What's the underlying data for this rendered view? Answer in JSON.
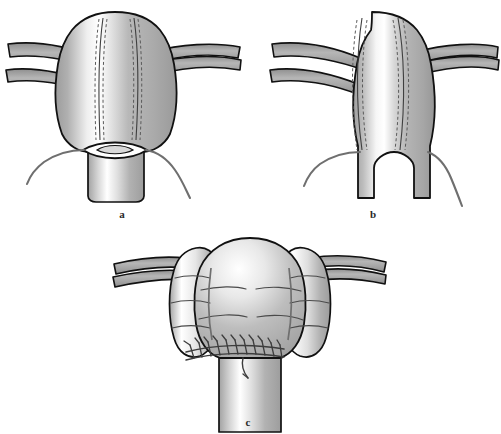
{
  "figure": {
    "background_color": "#ffffff",
    "panel_count": 3
  },
  "palette": {
    "outline": "#111111",
    "tissue_mid": "#b3b3b3",
    "tissue_dark": "#9a9a9a",
    "tissue_light": "#ffffff",
    "tube_fill": "#a8a8a8",
    "suture_thread": "#6f6f6f",
    "incision_line": "#4a4a4a",
    "dashed_line": "#5a5a5a",
    "lumen_white": "#ffffff",
    "label_color": "#2a2a2a"
  },
  "panels": [
    {
      "id": "a",
      "label": "a",
      "label_x": 122,
      "label_y": 218,
      "description": "Organ dome with paired vertical incision lines marked by solid and dashed guide lines; lens-shaped opening at the lower neck with two stay sutures exiting laterally.",
      "features": [
        "dome-body",
        "left-tube",
        "right-tube",
        "left-incision-line",
        "right-incision-line",
        "lens-opening",
        "left-stay-suture",
        "right-stay-suture",
        "neck-segment"
      ]
    },
    {
      "id": "b",
      "label": "b",
      "label_x": 373,
      "label_y": 218,
      "description": "Same organ after incisions extended downward, producing an inverted-U notch that divides the lower neck into two limbs; stay sutures remain at each limb.",
      "features": [
        "dome-body",
        "left-tube",
        "right-tube",
        "left-incision-line",
        "right-incision-line",
        "inverted-u-notch",
        "left-limb",
        "right-limb",
        "left-stay-suture",
        "right-stay-suture"
      ]
    },
    {
      "id": "c",
      "label": "c",
      "label_x": 248,
      "label_y": 424,
      "description": "Completed reconstruction: central dome flap with two lateral flaps folded down, horizontal fold creases visible, and a running suture line closing the transverse anastomosis above the neck.",
      "features": [
        "central-flap",
        "left-lateral-flap",
        "right-lateral-flap",
        "left-tube",
        "right-tube",
        "fold-crease-lines",
        "running-suture-line",
        "suture-tail",
        "neck-segment"
      ]
    }
  ],
  "annotations": {
    "incision_style": "solid line paired with dashed line",
    "suture_style": "running interrupted stitches",
    "tube_count_per_side": 1
  }
}
